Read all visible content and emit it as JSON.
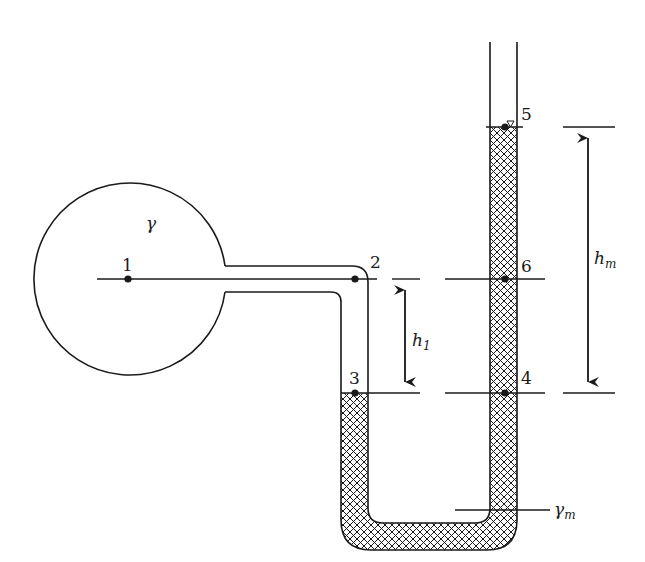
{
  "diagram": {
    "type": "U-tube manometer connected to a pressurized spherical vessel",
    "vessel": {
      "fluid_label": "γ"
    },
    "manometer": {
      "fluid_label": "γ",
      "fluid_label_sub": "m"
    },
    "points": [
      {
        "id": "1",
        "label": "1"
      },
      {
        "id": "2",
        "label": "2"
      },
      {
        "id": "3",
        "label": "3"
      },
      {
        "id": "4",
        "label": "4"
      },
      {
        "id": "5",
        "label": "5"
      },
      {
        "id": "6",
        "label": "6"
      }
    ],
    "dimensions": {
      "h1": {
        "label": "h",
        "sub": "1"
      },
      "hm": {
        "label": "h",
        "sub": "m"
      }
    },
    "colors": {
      "line": "#1a1a1a",
      "background": "#ffffff",
      "hatch": "#1a1a1a"
    }
  }
}
